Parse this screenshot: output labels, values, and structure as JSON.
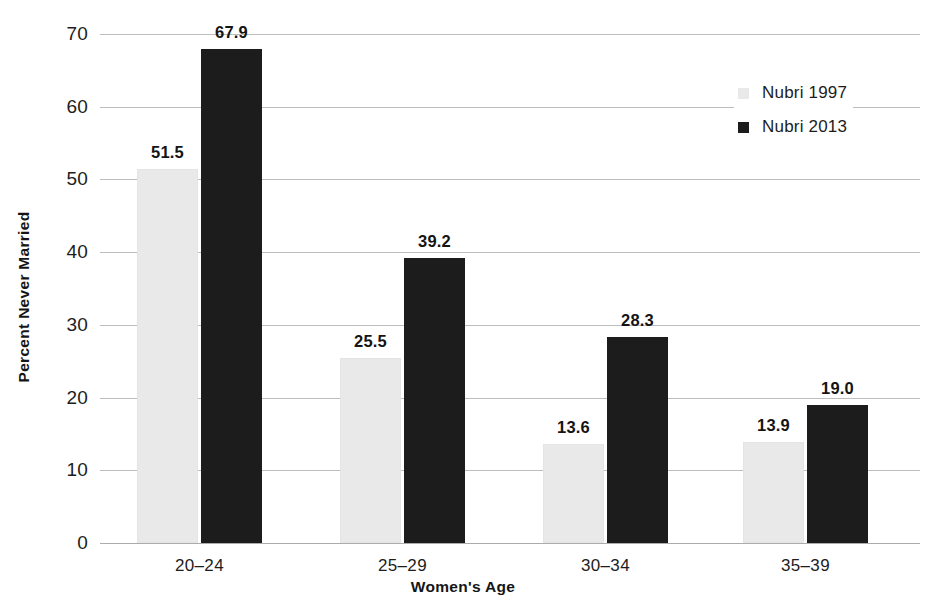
{
  "chart_data": {
    "type": "bar",
    "title": "",
    "subtitle": "",
    "xlabel": "Women's Age",
    "ylabel": "Percent Never Married",
    "categories": [
      "20–24",
      "25–29",
      "30–34",
      "35–39"
    ],
    "series": [
      {
        "name": "Nubri 1997",
        "values": [
          51.5,
          25.5,
          13.6,
          13.9
        ],
        "color": "#e9e9e9"
      },
      {
        "name": "Nubri 2013",
        "values": [
          67.9,
          39.2,
          28.3,
          19.0
        ],
        "color": "#1c1c1c"
      }
    ],
    "value_labels": [
      [
        "51.5",
        "25.5",
        "13.6",
        "13.9"
      ],
      [
        "67.9",
        "39.2",
        "28.3",
        "19.0"
      ]
    ],
    "ylim": [
      0,
      70
    ],
    "ytick_labels": [
      "0",
      "10",
      "20",
      "30",
      "40",
      "50",
      "60",
      "70"
    ],
    "ytick_values": [
      0,
      10,
      20,
      30,
      40,
      50,
      60,
      70
    ],
    "grid": true,
    "grid_axis": "y",
    "grid_color": "#b9b9b9",
    "legend_position": "top-right",
    "bar_value_labels": true
  },
  "legend": {
    "items": [
      {
        "label": "Nubri 1997",
        "swatch": "legend-swatch-1997"
      },
      {
        "label": "Nubri 2013",
        "swatch": "legend-swatch-2013"
      }
    ]
  }
}
